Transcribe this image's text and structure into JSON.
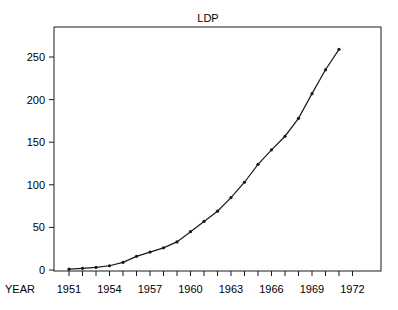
{
  "chart_data": {
    "type": "line",
    "title": "LDP",
    "xlabel": "YEAR",
    "ylabel": "",
    "x": [
      1951,
      1952,
      1953,
      1954,
      1955,
      1956,
      1957,
      1958,
      1959,
      1960,
      1961,
      1962,
      1963,
      1964,
      1965,
      1966,
      1967,
      1968,
      1969,
      1970,
      1971
    ],
    "series": [
      {
        "name": "LDP",
        "values": [
          1,
          2,
          3,
          5,
          9,
          16,
          21,
          26,
          33,
          45,
          57,
          69,
          85,
          103,
          124,
          141,
          157,
          178,
          207,
          235,
          259
        ],
        "color": "#1a1a1a",
        "marker": "dot"
      }
    ],
    "xlim": [
      1950,
      1974
    ],
    "ylim": [
      0,
      280
    ],
    "x_ticks": [
      1951,
      1954,
      1957,
      1960,
      1963,
      1966,
      1969,
      1972
    ],
    "x_minor_ticks_every": 1,
    "y_ticks": [
      0,
      50,
      100,
      150,
      200,
      250
    ],
    "grid": false,
    "legend": "none"
  }
}
